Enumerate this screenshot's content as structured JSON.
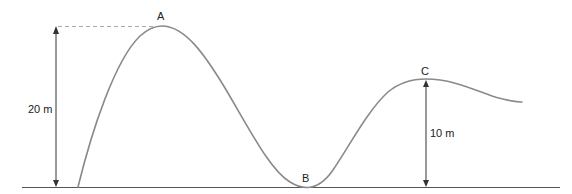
{
  "diagram": {
    "type": "roller-coaster-track-profile",
    "colors": {
      "track": "#8a8a8a",
      "ground": "#555555",
      "arrow": "#333333",
      "dashed": "#aaaaaa",
      "text": "#222222"
    },
    "points": [
      {
        "id": "A",
        "label": "A",
        "description": "highest peak"
      },
      {
        "id": "B",
        "label": "B",
        "description": "lowest point at ground level"
      },
      {
        "id": "C",
        "label": "C",
        "description": "second peak"
      }
    ],
    "dimensions": [
      {
        "id": "height-A",
        "label": "20 m",
        "from": "ground",
        "to": "A"
      },
      {
        "id": "height-C",
        "label": "10 m",
        "from": "ground",
        "to": "C"
      }
    ]
  }
}
